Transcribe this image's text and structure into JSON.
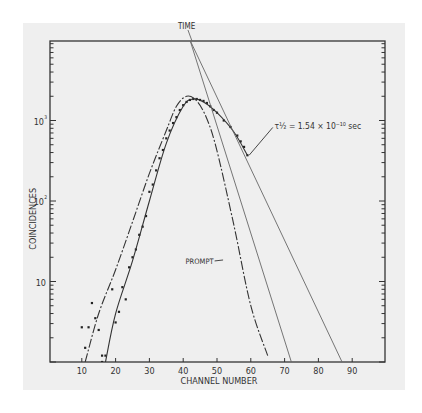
{
  "chart_data": {
    "type": "scatter",
    "title": "",
    "xlabel": "CHANNEL NUMBER",
    "ylabel": "COINCIDENCES",
    "xscale": "linear",
    "yscale": "log",
    "xlim": [
      0,
      100
    ],
    "ylim": [
      1,
      10000
    ],
    "x_ticks": [
      10,
      20,
      30,
      40,
      50,
      60,
      70,
      80,
      90
    ],
    "x_tick_labels": [
      "10",
      "20",
      "30",
      "40",
      "50",
      "60",
      "70",
      "80",
      "90"
    ],
    "y_ticks": [
      10,
      100,
      1000
    ],
    "y_tick_labels": [
      "10",
      "10²",
      "10³"
    ],
    "grid": false,
    "annotations": [
      {
        "text": "TIME",
        "x": 42,
        "y": 10000
      },
      {
        "text": "τ½ = 1.54 × 10⁻¹⁰ sec",
        "x": 67,
        "y": 700
      },
      {
        "text": "PROMPT",
        "x": 51,
        "y": 18
      }
    ],
    "series": [
      {
        "name": "measured",
        "style": "points",
        "points": [
          [
            10,
            2.7
          ],
          [
            11,
            1.5
          ],
          [
            12,
            2.7
          ],
          [
            13,
            5.4
          ],
          [
            14,
            3.5
          ],
          [
            15,
            2.5
          ],
          [
            16,
            1.0
          ],
          [
            16,
            1.2
          ],
          [
            17,
            1.2
          ],
          [
            19,
            8
          ],
          [
            20,
            3.1
          ],
          [
            21,
            4.2
          ],
          [
            22,
            8.5
          ],
          [
            23,
            6
          ],
          [
            24,
            15
          ],
          [
            25,
            20
          ],
          [
            26,
            25
          ],
          [
            27,
            38
          ],
          [
            28,
            48
          ],
          [
            29,
            65
          ],
          [
            30,
            130
          ],
          [
            31,
            160
          ],
          [
            32,
            240
          ],
          [
            33,
            340
          ],
          [
            34,
            430
          ],
          [
            35,
            600
          ],
          [
            36,
            750
          ],
          [
            37,
            930
          ],
          [
            38,
            1100
          ],
          [
            39,
            1350
          ],
          [
            40,
            1550
          ],
          [
            41,
            1700
          ],
          [
            42,
            1800
          ],
          [
            43,
            1850
          ],
          [
            44,
            1850
          ],
          [
            45,
            1800
          ],
          [
            46,
            1750
          ],
          [
            47,
            1650
          ],
          [
            48,
            1500
          ],
          [
            49,
            1350
          ],
          [
            50,
            1250
          ],
          [
            52,
            1000
          ],
          [
            54,
            830
          ],
          [
            56,
            650
          ],
          [
            57,
            550
          ],
          [
            58,
            470
          ],
          [
            59,
            370
          ]
        ]
      },
      {
        "name": "fit (delayed)",
        "style": "solid",
        "points": [
          [
            17,
            1
          ],
          [
            20,
            4
          ],
          [
            25,
            18
          ],
          [
            30,
            100
          ],
          [
            35,
            520
          ],
          [
            40,
            1500
          ],
          [
            43,
            1850
          ],
          [
            46,
            1700
          ],
          [
            50,
            1250
          ],
          [
            55,
            720
          ],
          [
            59,
            370
          ]
        ]
      },
      {
        "name": "prompt",
        "style": "dashed",
        "points": [
          [
            11,
            1
          ],
          [
            15,
            4
          ],
          [
            20,
            14
          ],
          [
            25,
            55
          ],
          [
            30,
            220
          ],
          [
            35,
            750
          ],
          [
            38,
            1500
          ],
          [
            41,
            2000
          ],
          [
            44,
            1750
          ],
          [
            47,
            1050
          ],
          [
            50,
            420
          ],
          [
            55,
            50
          ],
          [
            60,
            5
          ],
          [
            65,
            1.2
          ]
        ]
      },
      {
        "name": "prompt slope line",
        "style": "solid-thin",
        "points": [
          [
            42,
            10000
          ],
          [
            72,
            1
          ]
        ]
      },
      {
        "name": "TIME slope line (τ½)",
        "style": "solid-thin",
        "points": [
          [
            42,
            10000
          ],
          [
            87,
            1
          ]
        ]
      }
    ]
  }
}
